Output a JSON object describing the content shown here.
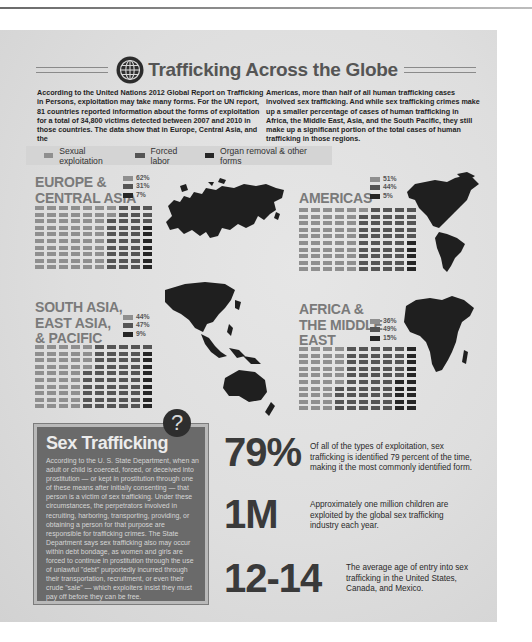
{
  "header": {
    "title": "Trafficking Across the Globe",
    "icon": "globe-icon"
  },
  "intro": {
    "left": "According to the United Nations 2012 Global Report on Trafficking in Persons, exploitation may take many forms. For the UN report, 81 countries reported information about the forms of exploitation for a total of 34,800 victims detected between 2007 and 2010 in those countries. The data show that in Europe, Central Asia, and the",
    "right": "Americas, more than half of all human trafficking cases involved sex trafficking. And while sex trafficking crimes make up a smaller percentage of cases of human trafficking in Africa, the Middle East, Asia, and the South Pacific, they still make up a significant portion of the total cases of human trafficking in those regions."
  },
  "legend": {
    "items": [
      {
        "label": "Sexual exploitation",
        "color": "#8f8f8f"
      },
      {
        "label": "Forced labor",
        "color": "#555555"
      },
      {
        "label": "Organ removal & other forms",
        "color": "#262626"
      }
    ]
  },
  "regions": [
    {
      "name_lines": [
        "EUROPE &",
        "CENTRAL ASIA"
      ],
      "pcts": [
        "62%",
        "31%",
        "7%"
      ]
    },
    {
      "name_lines": [
        "AMERICAS"
      ],
      "pcts": [
        "51%",
        "44%",
        "5%"
      ]
    },
    {
      "name_lines": [
        "SOUTH ASIA,",
        "EAST ASIA,",
        "& PACIFIC"
      ],
      "pcts": [
        "44%",
        "47%",
        "9%"
      ]
    },
    {
      "name_lines": [
        "AFRICA  &",
        "THE MIDDLE",
        "EAST"
      ],
      "pcts": [
        "36%",
        "49%",
        "15%"
      ]
    }
  ],
  "sex_trafficking": {
    "title": "Sex Trafficking",
    "badge_icon": "question-mark-icon",
    "badge_glyph": "?",
    "body": "According to the U. S. State Department, when an adult or child is coerced, forced, or deceived into prostitution — or kept in prostitution through one of these means after initially consenting — that person is a victim of sex trafficking. Under these circumstances, the perpetrators involved in recruiting, harboring, transporting, providing, or obtaining a person for that purpose are responsible for trafficking crimes. The State Department says sex trafficking also may occur within debt bondage, as women and girls are forced to continue in prostitution through the use of unlawful \"debt\" purportedly incurred through their transportation, recruitment, or even their crude \"sale\" — which exploiters insist they must pay off before they can be free."
  },
  "stats": [
    {
      "value": "79%",
      "text": "Of all of the types of exploitation, sex trafficking is identified 79 percent of the time, making it the most commonly identified form."
    },
    {
      "value": "1M",
      "text": "Approximately one million children are exploited by the global sex trafficking industry each year."
    },
    {
      "value": "12-14",
      "text": "The average age of entry into sex trafficking in the United States, Canada, and Mexico."
    }
  ],
  "chart_data": [
    {
      "type": "waffle",
      "title": "EUROPE & CENTRAL ASIA",
      "categories": [
        "Sexual exploitation",
        "Forced labor",
        "Organ removal & other forms"
      ],
      "values": [
        62,
        31,
        7
      ]
    },
    {
      "type": "waffle",
      "title": "AMERICAS",
      "categories": [
        "Sexual exploitation",
        "Forced labor",
        "Organ removal & other forms"
      ],
      "values": [
        51,
        44,
        5
      ]
    },
    {
      "type": "waffle",
      "title": "SOUTH ASIA, EAST ASIA, & PACIFIC",
      "categories": [
        "Sexual exploitation",
        "Forced labor",
        "Organ removal & other forms"
      ],
      "values": [
        44,
        47,
        9
      ]
    },
    {
      "type": "waffle",
      "title": "AFRICA & THE MIDDLE EAST",
      "categories": [
        "Sexual exploitation",
        "Forced labor",
        "Organ removal & other forms"
      ],
      "values": [
        36,
        49,
        15
      ]
    }
  ]
}
